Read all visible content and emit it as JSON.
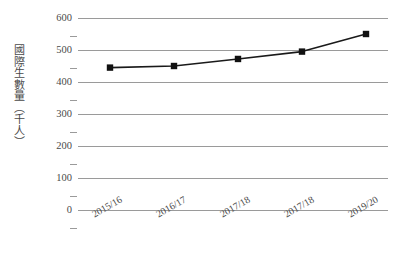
{
  "chart_data": {
    "type": "line",
    "title": "",
    "xlabel": "",
    "ylabel": "國際生數量（千人）",
    "categories": [
      "2015/16",
      "2016/17",
      "2017/18",
      "2017/18",
      "2019/20"
    ],
    "values": [
      445,
      450,
      472,
      495,
      550
    ],
    "series": [
      {
        "name": "國際生數量",
        "values": [
          445,
          450,
          472,
          495,
          550
        ]
      }
    ],
    "ylim": [
      0,
      600
    ],
    "y_ticks": [
      600,
      500,
      400,
      300,
      200,
      100,
      0
    ],
    "y_tick_labels": [
      "600",
      "500",
      "400",
      "300",
      "200",
      "100",
      "0"
    ],
    "grid": true,
    "grid_axis": "y",
    "legend": false,
    "legend_position": "none",
    "marker": "square",
    "colors": {
      "line": "#1a1a1a",
      "marker": "#111111",
      "gridline": "#9a9a9a",
      "text": "#4a4a4a",
      "background": "#ffffff"
    }
  },
  "axis": {
    "y_title": "國際生數量（千人）"
  }
}
